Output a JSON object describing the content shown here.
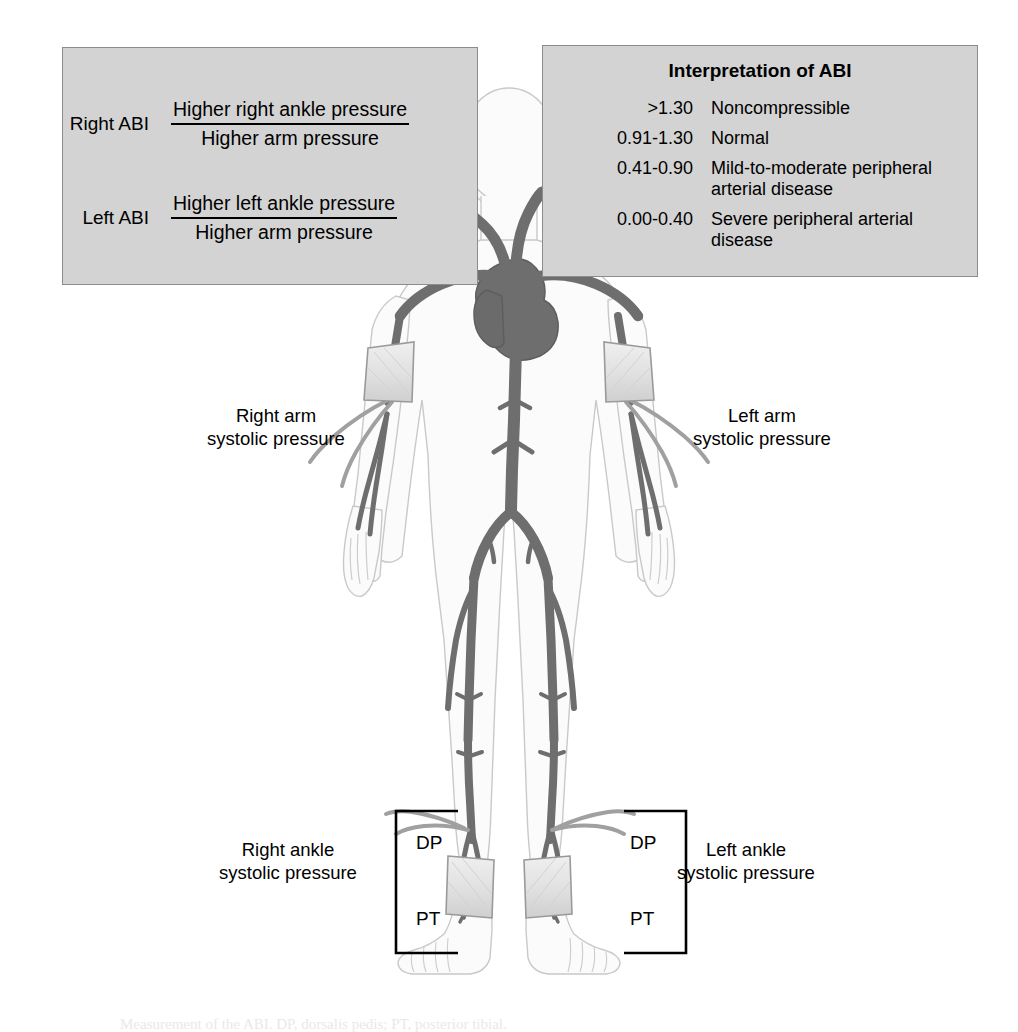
{
  "figure": {
    "caption": "Measurement of the ABI. DP, dorsalis pedis; PT, posterior tibial.",
    "colors": {
      "panel_background": "#d3d3d3",
      "panel_border": "#8c8c8c",
      "artery": "#6e6e6e",
      "artery_outline": "#4a4a4a",
      "body_fill": "#fbfbfb",
      "body_outline": "#c8c8c8",
      "cuff_fill": "#e3e3e3",
      "cuff_outline": "#9a9a9a",
      "tubing": "#9b9b9b",
      "text": "#000000"
    }
  },
  "formula_panel": {
    "rows": [
      {
        "side_label": "Right ABI",
        "numerator": "Higher right ankle pressure",
        "denominator": "Higher arm pressure"
      },
      {
        "side_label": "Left ABI",
        "numerator": "Higher left ankle pressure",
        "denominator": "Higher arm pressure"
      }
    ]
  },
  "interpretation_panel": {
    "title": "Interpretation of ABI",
    "rows": [
      {
        "range": ">1.30",
        "description": "Noncompressible"
      },
      {
        "range": "0.91-1.30",
        "description": "Normal"
      },
      {
        "range": "0.41-0.90",
        "description": "Mild-to-moderate peripheral arterial disease"
      },
      {
        "range": "0.00-0.40",
        "description": "Severe peripheral arterial disease"
      }
    ]
  },
  "callouts": {
    "right_arm": "Right arm\nsystolic pressure",
    "left_arm": "Left arm\nsystolic pressure",
    "right_ankle": "Right ankle\nsystolic pressure",
    "left_ankle": "Left ankle\nsystolic pressure"
  },
  "vessel_tags": {
    "right": {
      "dp": "DP",
      "pt": "PT"
    },
    "left": {
      "dp": "DP",
      "pt": "PT"
    }
  }
}
